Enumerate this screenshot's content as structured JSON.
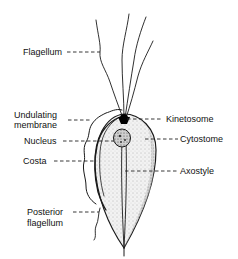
{
  "diagram": {
    "labels": {
      "flagellum": "Flagellum",
      "undulating_membrane_1": "Undulating",
      "undulating_membrane_2": "membrane",
      "nucleus": "Nucleus",
      "costa": "Costa",
      "posterior_flagellum_1": "Posterior",
      "posterior_flagellum_2": "flagellum",
      "kinetosome": "Kinetosome",
      "cytostome": "Cytostome",
      "axostyle": "Axostyle"
    }
  }
}
